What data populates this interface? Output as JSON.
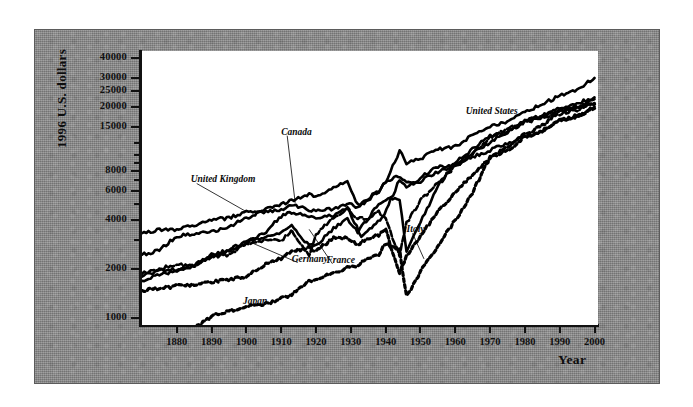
{
  "chart_data": {
    "type": "line",
    "title": "",
    "xlabel": "Year",
    "ylabel": "1996 U.S. dollars",
    "scale": "log",
    "grid": false,
    "legend_position": "inline-annotations",
    "xlim": [
      1870,
      2001
    ],
    "ylim": [
      900,
      44000
    ],
    "xticks": [
      1880,
      1890,
      1900,
      1910,
      1920,
      1930,
      1940,
      1950,
      1960,
      1970,
      1980,
      1990,
      2000
    ],
    "xtick_labels": [
      "1880",
      "1890",
      "1900",
      "1910",
      "1920",
      "1930",
      "1940",
      "1950",
      "1960",
      "1970",
      "1980",
      "1990",
      "2000"
    ],
    "yticks": [
      1000,
      2000,
      4000,
      6000,
      8000,
      15000,
      20000,
      25000,
      30000,
      40000
    ],
    "ytick_labels": [
      "1000",
      "2000",
      "4000",
      "6000",
      "8000",
      "15000",
      "20000",
      "25000",
      "30000",
      "40000"
    ],
    "yticks_minor": [
      3000,
      5000,
      7000,
      9000,
      10000,
      12000
    ],
    "series": [
      {
        "name": "United States",
        "style": "solid",
        "label_x": 1963,
        "label_y": 18500,
        "leader": false,
        "x": [
          1870,
          1875,
          1880,
          1885,
          1890,
          1895,
          1900,
          1905,
          1910,
          1913,
          1918,
          1920,
          1925,
          1929,
          1932,
          1935,
          1938,
          1940,
          1944,
          1946,
          1950,
          1955,
          1960,
          1965,
          1970,
          1975,
          1980,
          1985,
          1990,
          1995,
          2000
        ],
        "y": [
          2445,
          2600,
          3184,
          3300,
          3396,
          3644,
          4091,
          4642,
          4964,
          5301,
          5757,
          5552,
          6282,
          6899,
          4908,
          5467,
          5979,
          6838,
          10700,
          8900,
          9561,
          10897,
          11328,
          13419,
          15030,
          16284,
          18577,
          20717,
          23201,
          25467,
          30000
        ]
      },
      {
        "name": "Canada",
        "style": "solid",
        "label_x": 1910,
        "label_y": 13800,
        "leader": true,
        "leader_to_x": 1914,
        "leader_to_y": 5100,
        "x": [
          1870,
          1875,
          1880,
          1885,
          1890,
          1895,
          1900,
          1905,
          1910,
          1913,
          1918,
          1920,
          1925,
          1929,
          1933,
          1936,
          1939,
          1944,
          1946,
          1950,
          1955,
          1960,
          1965,
          1970,
          1975,
          1980,
          1985,
          1990,
          1995,
          2000
        ],
        "y": [
          1695,
          1850,
          1934,
          2100,
          2378,
          2570,
          2911,
          3300,
          4213,
          4447,
          4247,
          4085,
          4285,
          4811,
          3174,
          3592,
          4110,
          7050,
          6300,
          7291,
          8512,
          8753,
          10410,
          12050,
          13840,
          16176,
          17660,
          18933,
          19500,
          22198
        ]
      },
      {
        "name": "United Kingdom",
        "style": "solid",
        "label_x": 1884,
        "label_y": 7000,
        "leader": true,
        "leader_to_x": 1900,
        "leader_to_y": 4492,
        "x": [
          1870,
          1875,
          1880,
          1885,
          1890,
          1895,
          1900,
          1905,
          1910,
          1913,
          1918,
          1920,
          1925,
          1929,
          1932,
          1935,
          1938,
          1940,
          1943,
          1946,
          1950,
          1955,
          1960,
          1965,
          1970,
          1975,
          1980,
          1985,
          1990,
          1995,
          2000
        ],
        "y": [
          3263,
          3500,
          3477,
          3700,
          4009,
          4100,
          4492,
          4424,
          4611,
          4921,
          4635,
          4548,
          4680,
          5057,
          4751,
          5350,
          5983,
          6856,
          7300,
          6900,
          6939,
          7868,
          8645,
          9752,
          10767,
          11875,
          12931,
          14071,
          16430,
          17287,
          20000
        ]
      },
      {
        "name": "Germany",
        "style": "solid",
        "label_x": 1913,
        "label_y": 2280,
        "leader": true,
        "leader_to_x": 1900,
        "leader_to_y": 2985,
        "x": [
          1870,
          1875,
          1880,
          1885,
          1890,
          1895,
          1900,
          1905,
          1910,
          1913,
          1918,
          1920,
          1925,
          1929,
          1932,
          1935,
          1938,
          1940,
          1944,
          1946,
          1950,
          1955,
          1960,
          1965,
          1970,
          1975,
          1980,
          1985,
          1990,
          1995,
          2000
        ],
        "y": [
          1821,
          1950,
          1991,
          2100,
          2428,
          2600,
          2985,
          3104,
          3348,
          3648,
          2796,
          2796,
          3532,
          4051,
          3362,
          4120,
          4994,
          5403,
          5403,
          2503,
          3881,
          6430,
          9000,
          10900,
          13150,
          14100,
          16300,
          17400,
          19441,
          20900,
          22800
        ]
      },
      {
        "name": "France",
        "style": "dashed",
        "label_x": 1923,
        "label_y": 2240,
        "leader": true,
        "leader_to_x": 1918,
        "leader_to_y": 3500,
        "x": [
          1870,
          1875,
          1880,
          1885,
          1890,
          1895,
          1900,
          1905,
          1910,
          1913,
          1918,
          1920,
          1925,
          1929,
          1932,
          1935,
          1938,
          1940,
          1944,
          1946,
          1950,
          1955,
          1960,
          1965,
          1970,
          1975,
          1980,
          1985,
          1990,
          1995,
          2000
        ],
        "y": [
          1876,
          2000,
          2120,
          2100,
          2376,
          2450,
          2876,
          2966,
          2965,
          3485,
          2400,
          3227,
          4166,
          4710,
          4065,
          4086,
          4466,
          4042,
          2400,
          3818,
          5271,
          6800,
          8531,
          10400,
          12900,
          14600,
          16100,
          17000,
          18093,
          19000,
          21000
        ]
      },
      {
        "name": "Italy",
        "style": "dotted",
        "label_x": 1946,
        "label_y": 3450,
        "leader": true,
        "leader_to_x": 1951,
        "leader_to_y": 2300,
        "x": [
          1870,
          1875,
          1880,
          1885,
          1890,
          1895,
          1900,
          1905,
          1910,
          1913,
          1918,
          1920,
          1925,
          1929,
          1932,
          1935,
          1938,
          1940,
          1944,
          1946,
          1950,
          1955,
          1960,
          1965,
          1970,
          1975,
          1980,
          1985,
          1990,
          1995,
          2000
        ],
        "y": [
          1467,
          1500,
          1581,
          1600,
          1667,
          1700,
          1785,
          2100,
          2332,
          2564,
          2700,
          2587,
          3100,
          3093,
          2800,
          3100,
          3244,
          3505,
          1850,
          2400,
          3172,
          4500,
          5916,
          7700,
          9719,
          10700,
          13100,
          14200,
          16313,
          17500,
          19500
        ]
      },
      {
        "name": "Japan",
        "style": "dotted",
        "label_x": 1899,
        "label_y": 1250,
        "leader": false,
        "x": [
          1870,
          1875,
          1880,
          1885,
          1890,
          1895,
          1900,
          1905,
          1910,
          1913,
          1918,
          1920,
          1925,
          1929,
          1932,
          1935,
          1938,
          1940,
          1944,
          1946,
          1950,
          1955,
          1960,
          1965,
          1970,
          1975,
          1980,
          1985,
          1990,
          1995,
          2000
        ],
        "y": [
          737,
          760,
          850,
          860,
          1012,
          1100,
          1180,
          1200,
          1304,
          1387,
          1700,
          1696,
          1885,
          2026,
          2100,
          2300,
          2450,
          2874,
          2600,
          1350,
          1921,
          2771,
          3986,
          5934,
          9714,
          11344,
          13428,
          15331,
          18789,
          19979,
          20738
        ]
      }
    ]
  },
  "axes": {
    "y_title": "1996 U.S. dollars",
    "x_title": "Year"
  }
}
